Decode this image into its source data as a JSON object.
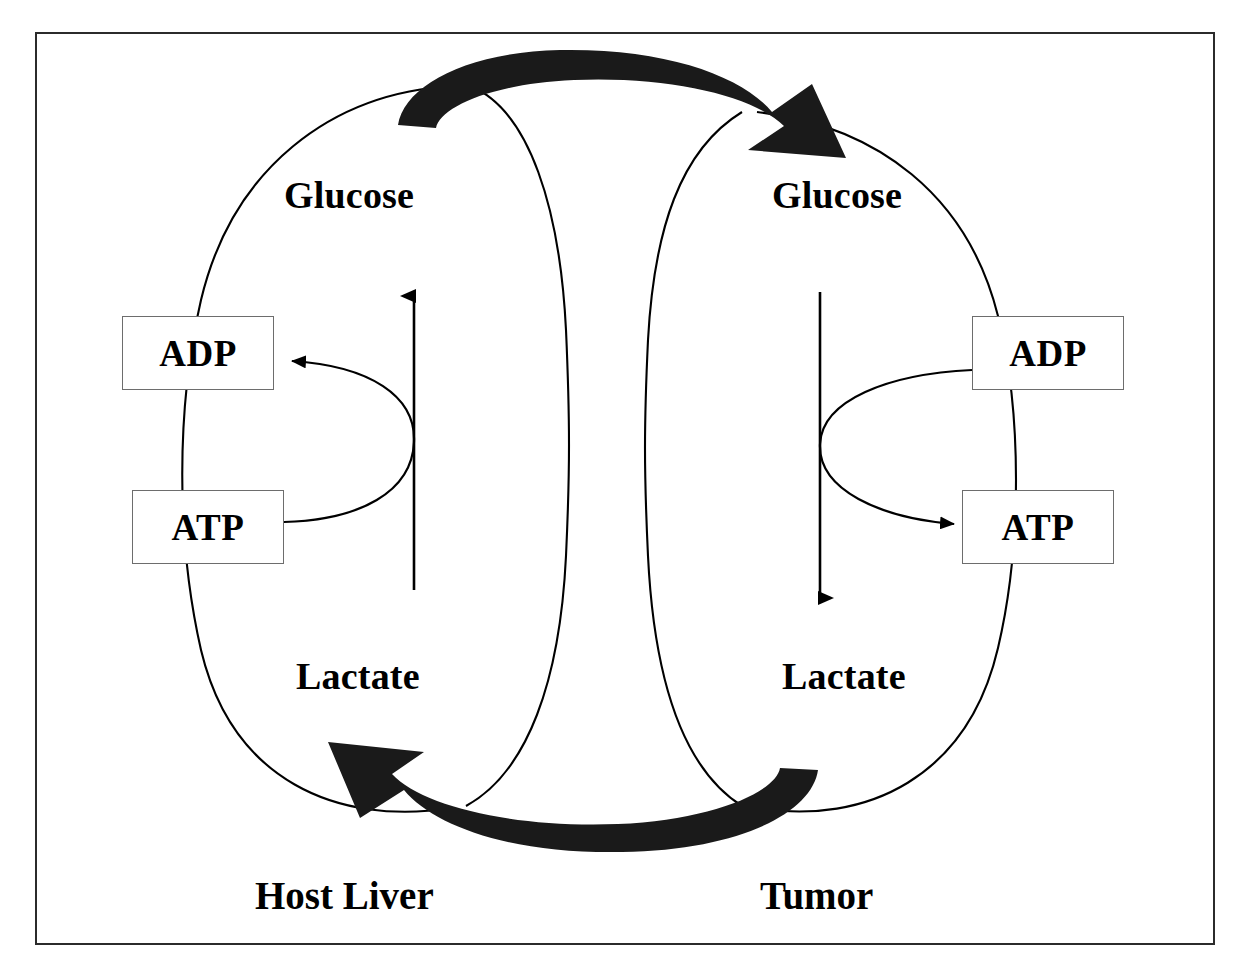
{
  "figure": {
    "caption_fragment": "",
    "alt": "Cori cycle between host liver and tumor"
  },
  "diagram": {
    "type": "cycle-diagram",
    "background_color": "#ffffff",
    "line_color": "#000000",
    "arrow_fill_color": "#1a1a1a",
    "frame_color": "#2b2b2b",
    "box_border_color": "#6d6d6d",
    "compartments": [
      {
        "id": "host-liver",
        "label": "Host Liver",
        "side": "left"
      },
      {
        "id": "tumor",
        "label": "Tumor",
        "side": "right"
      }
    ],
    "metabolites": [
      {
        "id": "glucose-left",
        "label": "Glucose",
        "compartment": "host-liver"
      },
      {
        "id": "lactate-left",
        "label": "Lactate",
        "compartment": "host-liver"
      },
      {
        "id": "glucose-right",
        "label": "Glucose",
        "compartment": "tumor"
      },
      {
        "id": "lactate-right",
        "label": "Lactate",
        "compartment": "tumor"
      }
    ],
    "energy_boxes": [
      {
        "id": "adp-left",
        "label": "ADP",
        "compartment": "host-liver"
      },
      {
        "id": "atp-left",
        "label": "ATP",
        "compartment": "host-liver"
      },
      {
        "id": "adp-right",
        "label": "ADP",
        "compartment": "tumor"
      },
      {
        "id": "atp-right",
        "label": "ATP",
        "compartment": "tumor"
      }
    ],
    "flows": [
      {
        "id": "glucose-transfer",
        "from": "glucose-left",
        "to": "glucose-right",
        "direction": "left-to-right",
        "style": "thick-black-curved-arrow",
        "position": "top"
      },
      {
        "id": "lactate-transfer",
        "from": "lactate-right",
        "to": "lactate-left",
        "direction": "right-to-left",
        "style": "thick-black-curved-arrow",
        "position": "bottom"
      },
      {
        "id": "gluconeogenesis",
        "from": "lactate-left",
        "to": "glucose-left",
        "direction": "up",
        "style": "thin-arrow",
        "compartment": "host-liver"
      },
      {
        "id": "glycolysis",
        "from": "glucose-right",
        "to": "lactate-right",
        "direction": "down",
        "style": "thin-arrow",
        "compartment": "tumor"
      },
      {
        "id": "atp-consumption-liver",
        "from": "atp-left",
        "to": "adp-left",
        "direction": "right-to-left",
        "style": "thin-curved-arrow",
        "compartment": "host-liver"
      },
      {
        "id": "atp-production-tumor",
        "from": "adp-right",
        "to": "atp-right",
        "direction": "left-to-right",
        "style": "thin-curved-arrow",
        "compartment": "tumor"
      }
    ]
  }
}
